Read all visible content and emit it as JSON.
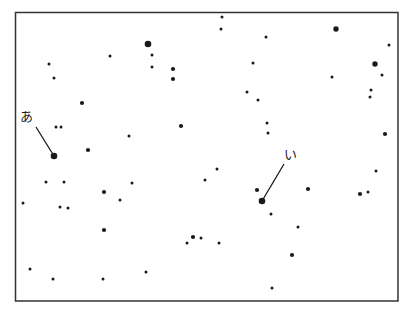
{
  "labels": [
    {
      "id": "a",
      "text": "あ",
      "star": [
        54,
        156
      ],
      "anchor": [
        30,
        117
      ]
    },
    {
      "id": "i",
      "text": "い",
      "star": [
        262,
        201
      ],
      "anchor": [
        284,
        154
      ]
    }
  ],
  "colors": {
    "ink": "#1a1a1a",
    "frame": "#333333",
    "background": "#ffffff"
  },
  "stars": [
    [
      49,
      64,
      1
    ],
    [
      54,
      78,
      1
    ],
    [
      82,
      103,
      1.5
    ],
    [
      110,
      56,
      1
    ],
    [
      148,
      44,
      2.5
    ],
    [
      152,
      55,
      1
    ],
    [
      152,
      67,
      1
    ],
    [
      173,
      69,
      1.5
    ],
    [
      173,
      79,
      1.5
    ],
    [
      222,
      17,
      1
    ],
    [
      221,
      29,
      1
    ],
    [
      266,
      37,
      1
    ],
    [
      253,
      63,
      1
    ],
    [
      336,
      29,
      2
    ],
    [
      389,
      45,
      1
    ],
    [
      375,
      64,
      2
    ],
    [
      382,
      75,
      1
    ],
    [
      332,
      77,
      1
    ],
    [
      247,
      92,
      1
    ],
    [
      258,
      100,
      1
    ],
    [
      371,
      90,
      1
    ],
    [
      370,
      97,
      1
    ],
    [
      385,
      134,
      1.5
    ],
    [
      56,
      127,
      1
    ],
    [
      61,
      127,
      1
    ],
    [
      129,
      136,
      1
    ],
    [
      181,
      126,
      1.5
    ],
    [
      267,
      123,
      1
    ],
    [
      268,
      133,
      1
    ],
    [
      88,
      150,
      1.5
    ],
    [
      54,
      156,
      2.5
    ],
    [
      46,
      182,
      1
    ],
    [
      64,
      182,
      1
    ],
    [
      104,
      192,
      1.5
    ],
    [
      120,
      200,
      1
    ],
    [
      132,
      183,
      1
    ],
    [
      23,
      203,
      1
    ],
    [
      60,
      207,
      1
    ],
    [
      68,
      208,
      1
    ],
    [
      104,
      230,
      1.5
    ],
    [
      217,
      169,
      1
    ],
    [
      205,
      180,
      1
    ],
    [
      257,
      190,
      1.5
    ],
    [
      262,
      201,
      2.5
    ],
    [
      271,
      214,
      1
    ],
    [
      308,
      189,
      1.5
    ],
    [
      376,
      171,
      1
    ],
    [
      360,
      194,
      1.5
    ],
    [
      368,
      192,
      1
    ],
    [
      298,
      227,
      1
    ],
    [
      193,
      237,
      1.5
    ],
    [
      201,
      238,
      1
    ],
    [
      187,
      243,
      1
    ],
    [
      219,
      243,
      1
    ],
    [
      292,
      255,
      1.5
    ],
    [
      30,
      269,
      1
    ],
    [
      53,
      279,
      1
    ],
    [
      103,
      279,
      1
    ],
    [
      146,
      272,
      1
    ],
    [
      272,
      288,
      1
    ]
  ]
}
